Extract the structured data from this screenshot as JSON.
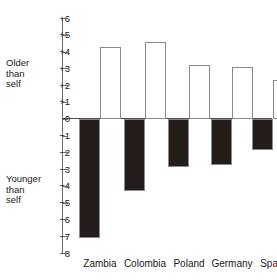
{
  "annotations": {
    "older_label": "Older\nthan\nself",
    "younger_label": "Younger\nthan\nself"
  },
  "axis": {
    "ticks": [
      "+6",
      "+5",
      "+4",
      "+3",
      "+2",
      "+1",
      "0",
      "−1",
      "−2",
      "−3",
      "−4",
      "−5",
      "−6",
      "−7",
      "−8"
    ]
  },
  "colors": {
    "older_bar": "#ffffff",
    "younger_bar": "#231c1a",
    "bar_outline": "#8a8a8a",
    "axis": "#6b6b6b",
    "text": "#1a1a1a"
  },
  "chart_data": {
    "type": "bar",
    "title": "",
    "xlabel": "",
    "ylabel": "",
    "ylim": [
      -8,
      6
    ],
    "grid": false,
    "legend": "none",
    "categories": [
      "Zambia",
      "Colombia",
      "Poland",
      "Germany",
      "Spain"
    ],
    "series": [
      {
        "name": "Younger than self",
        "values": [
          -7.1,
          -4.3,
          -2.85,
          -2.75,
          -1.85
        ]
      },
      {
        "name": "Older than self",
        "values": [
          4.3,
          4.6,
          3.2,
          3.1,
          2.3
        ]
      }
    ],
    "annotations": [
      "Older than self",
      "Younger than self"
    ]
  }
}
